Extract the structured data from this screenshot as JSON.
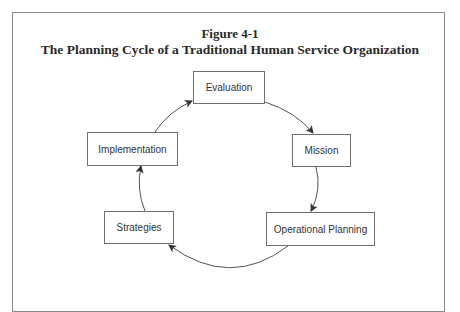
{
  "figure": {
    "label": "Figure 4-1",
    "title": "The Planning Cycle of a Traditional Human Service Organization"
  },
  "cycle": {
    "nodes": [
      {
        "id": "evaluation",
        "label": "Evaluation"
      },
      {
        "id": "mission",
        "label": "Mission"
      },
      {
        "id": "operational-planning",
        "label": "Operational Planning"
      },
      {
        "id": "strategies",
        "label": "Strategies"
      },
      {
        "id": "implementation",
        "label": "Implementation"
      }
    ],
    "edges": [
      {
        "from": "evaluation",
        "to": "mission"
      },
      {
        "from": "mission",
        "to": "operational-planning"
      },
      {
        "from": "operational-planning",
        "to": "strategies"
      },
      {
        "from": "strategies",
        "to": "implementation"
      },
      {
        "from": "implementation",
        "to": "evaluation"
      }
    ]
  },
  "colors": {
    "border": "#8a8a8a",
    "box_border": "#707070",
    "text": "#333333"
  }
}
